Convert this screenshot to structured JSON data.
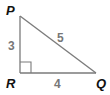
{
  "diagram": {
    "type": "right-triangle",
    "colors": {
      "line": "#7a7a7a",
      "vertex_label": "#111111",
      "side_label": "#777777",
      "background": "#ffffff"
    },
    "vertices": {
      "P": {
        "label": "P",
        "x": 20,
        "y": 16
      },
      "R": {
        "label": "R",
        "x": 20,
        "y": 73
      },
      "Q": {
        "label": "Q",
        "x": 96,
        "y": 73
      }
    },
    "sides": {
      "PR": {
        "label": "3"
      },
      "PQ": {
        "label": "5"
      },
      "RQ": {
        "label": "4"
      }
    },
    "right_angle_at": "R"
  }
}
